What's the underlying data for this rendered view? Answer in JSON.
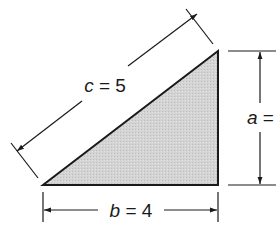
{
  "diagram": {
    "type": "right-triangle-dimensions",
    "fill_color": "#d2d2d2",
    "stroke_color": "#1a1a1a",
    "vertices": {
      "bottom_left": [
        43,
        185
      ],
      "bottom_right": [
        218,
        185
      ],
      "top_right": [
        218,
        51
      ]
    },
    "sides": {
      "hypotenuse": {
        "var": "c",
        "eq": " = ",
        "value": "5"
      },
      "vertical": {
        "var": "a",
        "eq": " = ",
        "value": "3"
      },
      "horizontal": {
        "var": "b",
        "eq": " = ",
        "value": "4"
      }
    }
  }
}
